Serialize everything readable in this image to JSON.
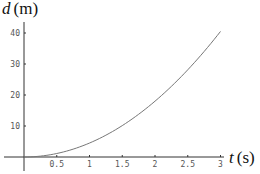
{
  "chart_data": {
    "type": "line",
    "title": "",
    "xlabel": "t (s)",
    "xlabel_var": "t",
    "xlabel_unit": "(s)",
    "ylabel": "d (m)",
    "ylabel_var": "d",
    "ylabel_unit": "(m)",
    "xlim": [
      0,
      3
    ],
    "ylim": [
      0,
      40
    ],
    "x_ticks": [
      "0.5",
      "1",
      "1.5",
      "2",
      "2.5",
      "3"
    ],
    "x_tick_values": [
      0.5,
      1,
      1.5,
      2,
      2.5,
      3
    ],
    "y_ticks": [
      "10",
      "20",
      "30",
      "40"
    ],
    "y_tick_values": [
      10,
      20,
      30,
      40
    ],
    "grid": false,
    "legend": null,
    "series": [
      {
        "name": "d(t)",
        "color": "#777777",
        "x": [
          0,
          0.25,
          0.5,
          0.75,
          1,
          1.25,
          1.5,
          1.75,
          2,
          2.25,
          2.5,
          2.75,
          3
        ],
        "values": [
          0,
          0.28,
          1.13,
          2.53,
          4.5,
          7.03,
          10.13,
          13.78,
          18,
          22.78,
          28.13,
          34.03,
          40.5
        ]
      }
    ]
  }
}
